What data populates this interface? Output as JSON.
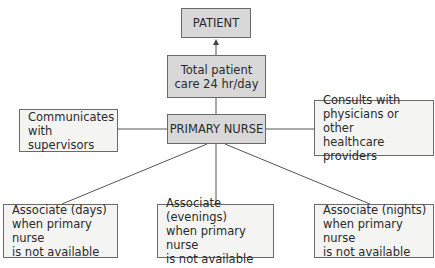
{
  "diagram": {
    "type": "organizational-chart",
    "nodes": {
      "patient": {
        "label": "PATIENT"
      },
      "total_care": {
        "label": "Total patient\ncare 24 hr/day"
      },
      "primary_nurse": {
        "label": "PRIMARY NURSE"
      },
      "communicates": {
        "label": "Communicates\nwith supervisors"
      },
      "consults": {
        "label": "Consults with\nphysicians or other\nhealthcare providers"
      },
      "associate_days": {
        "label": "Associate (days)\nwhen primary nurse\nis not available"
      },
      "associate_evenings": {
        "label": "Associate (evenings)\nwhen primary nurse\nis not available"
      },
      "associate_nights": {
        "label": "Associate (nights)\nwhen primary nurse\nis not available"
      }
    },
    "edges": [
      {
        "from": "total_care",
        "to": "patient",
        "arrow": true
      },
      {
        "from": "primary_nurse",
        "to": "total_care",
        "arrow": false
      },
      {
        "from": "primary_nurse",
        "to": "communicates",
        "arrow": false
      },
      {
        "from": "primary_nurse",
        "to": "consults",
        "arrow": false
      },
      {
        "from": "primary_nurse",
        "to": "associate_days",
        "arrow": false
      },
      {
        "from": "primary_nurse",
        "to": "associate_evenings",
        "arrow": false
      },
      {
        "from": "primary_nurse",
        "to": "associate_nights",
        "arrow": false
      }
    ],
    "colors": {
      "shaded_fill": "#d8d8d8",
      "light_fill": "#f4f4f2",
      "border": "#6a6a6a",
      "line": "#555555"
    }
  }
}
